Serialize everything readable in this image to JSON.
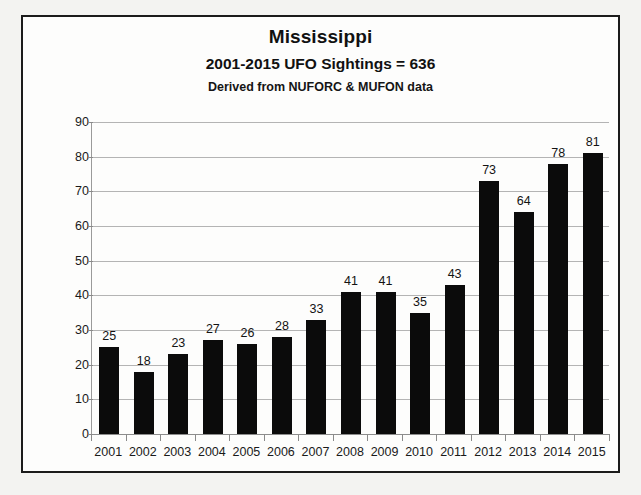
{
  "chart_data": {
    "type": "bar",
    "title": "Mississippi",
    "subtitle": "2001-2015 UFO Sightings = 636",
    "source_note": "Derived from NUFORC & MUFON data",
    "xlabel": "",
    "ylabel": "",
    "ylim": [
      0,
      90
    ],
    "y_ticks": [
      0,
      10,
      20,
      30,
      40,
      50,
      60,
      70,
      80,
      90
    ],
    "grid": true,
    "legend": "none",
    "bar_color": "#0b0b0b",
    "categories": [
      "2001",
      "2002",
      "2003",
      "2004",
      "2005",
      "2006",
      "2007",
      "2008",
      "2009",
      "2010",
      "2011",
      "2012",
      "2013",
      "2014",
      "2015"
    ],
    "values": [
      25,
      18,
      23,
      27,
      26,
      28,
      33,
      41,
      41,
      35,
      43,
      73,
      64,
      78,
      81
    ],
    "data_labels": [
      "25",
      "18",
      "23",
      "27",
      "26",
      "28",
      "33",
      "41",
      "41",
      "35",
      "43",
      "73",
      "64",
      "78",
      "81"
    ]
  }
}
